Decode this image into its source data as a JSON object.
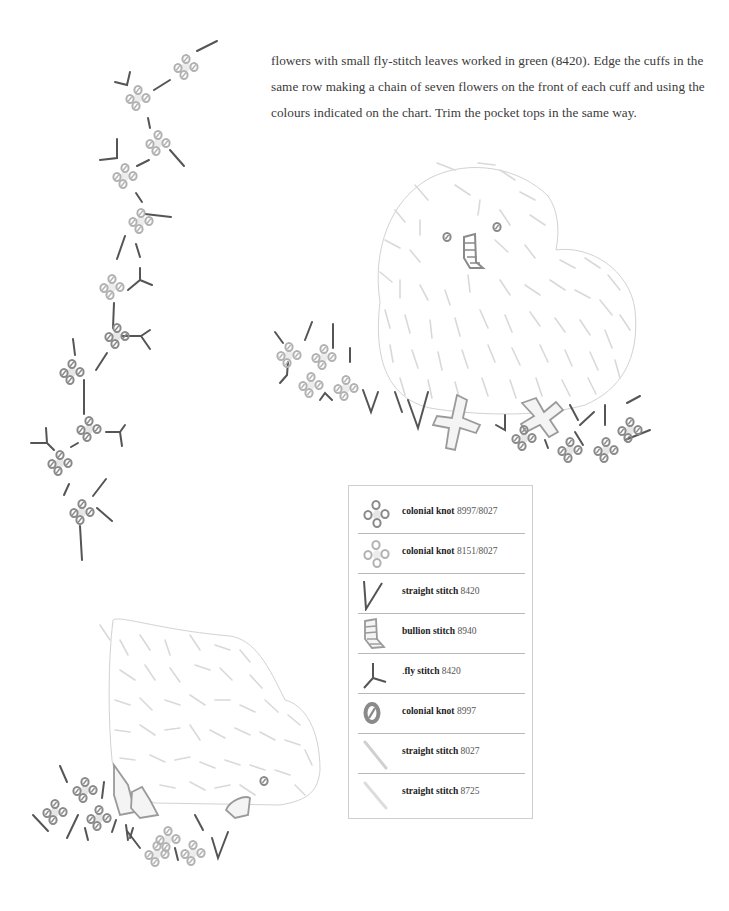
{
  "document": {
    "intro_text": {
      "line1": "flowers with small fly-stitch leaves worked in green (8420). Edge the cuffs in the",
      "line2": "same row making a chain of seven flowers on the front of each cuff and using the",
      "line3": "colours indicated on the chart. Trim the pocket tops in the same way."
    }
  },
  "legend": {
    "items": [
      {
        "icon": "colonial-knot-dark-flower-icon",
        "stitch": "colonial knot",
        "code": "8997/8027"
      },
      {
        "icon": "colonial-knot-light-flower-icon",
        "stitch": "colonial knot",
        "code": "8151/8027"
      },
      {
        "icon": "straight-stitch-v-icon",
        "stitch": "straight stitch",
        "code": "8420"
      },
      {
        "icon": "bullion-stitch-icon",
        "stitch": "bullion stitch",
        "code": "8940"
      },
      {
        "icon": "fly-stitch-icon",
        "stitch": "fly stitch",
        "code": "8420",
        "prefix": "."
      },
      {
        "icon": "colonial-knot-single-icon",
        "stitch": "colonial knot",
        "code": "8997"
      },
      {
        "icon": "straight-stitch-light-icon",
        "stitch": "straight stitch",
        "code": "8027"
      },
      {
        "icon": "straight-stitch-pale-icon",
        "stitch": "straight stitch",
        "code": "8725"
      }
    ]
  },
  "colors": {
    "dark_stitch": "#555555",
    "knot_dark": "#8a8a8a",
    "knot_light": "#b5b5b5",
    "knot_center": "#e4e4e4",
    "outline": "#cfcfcf",
    "fur_stitch": "#d6d6d6",
    "bullion": "#9c9c9c"
  }
}
